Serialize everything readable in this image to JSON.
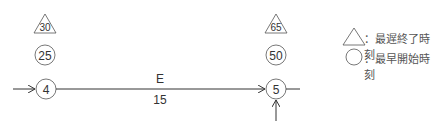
{
  "diagram": {
    "type": "arrow-diagram",
    "nodes": [
      {
        "id": "4",
        "label": "4",
        "earliest_start": "25",
        "latest_finish": "30"
      },
      {
        "id": "5",
        "label": "5",
        "earliest_start": "50",
        "latest_finish": "65"
      }
    ],
    "activity": {
      "name": "E",
      "duration": "15",
      "from": "4",
      "to": "5"
    }
  },
  "legend": {
    "triangle_label": "：最遅終了時刻",
    "circle_label": "：最早開始時刻"
  },
  "colors": {
    "line": "#333333",
    "text": "#333333"
  }
}
